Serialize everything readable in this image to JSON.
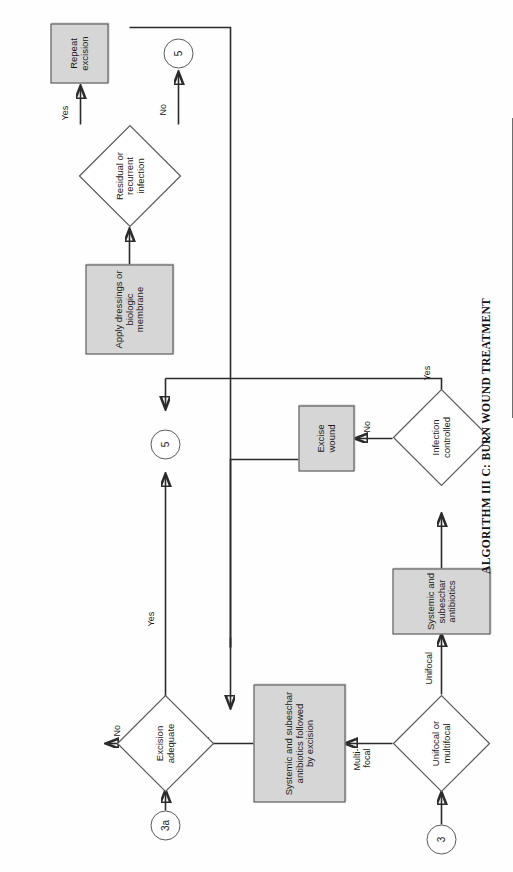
{
  "caption": {
    "text": "ALGORITHM III C:  BURN WOUND TREATMENT"
  },
  "colors": {
    "process_fill": "#d6d6d6",
    "stroke": "#2b2b2b",
    "node_border": "#4a4a4a",
    "page_background": "#ffffff"
  },
  "nodes": {
    "entry_3": {
      "label": "3",
      "shape": "connector"
    },
    "entry_3a": {
      "label": "3a",
      "shape": "connector"
    },
    "exit_5_top": {
      "label": "5",
      "shape": "connector"
    },
    "exit_5_mid": {
      "label": "5",
      "shape": "connector"
    },
    "unifocal_or_multifocal": {
      "label": "Unifocal or\nmultifocal",
      "shape": "decision"
    },
    "infection_controlled": {
      "label": "Infection\ncontrolled",
      "shape": "decision"
    },
    "excision_adequate": {
      "label": "Excision\nadequate",
      "shape": "decision"
    },
    "residual_or_recurrent_infection": {
      "label": "Residual or\nrecurrent\ninfection",
      "shape": "decision"
    },
    "systemic_subeschar_antibiotics": {
      "label": "Systemic and subeschar\nantibiotics",
      "shape": "process"
    },
    "systemic_subeschar_antibiotics_excision": {
      "label": "Systemic and subeschar\nantibiotics followed\nby excision",
      "shape": "process"
    },
    "excise_wound": {
      "label": "Excise wound",
      "shape": "process"
    },
    "apply_dressings": {
      "label": "Apply dressings or\nbiologic\nmembrane",
      "shape": "process"
    },
    "repeat_excision": {
      "label": "Repeat excision",
      "shape": "process"
    }
  },
  "edge_labels": {
    "unifocal": "Unifocal",
    "multifocal": "Multi-\nfocal",
    "infection_no": "No",
    "infection_yes": "Yes",
    "excision_yes": "Yes",
    "excision_no": "No",
    "residual_yes": "Yes",
    "residual_no": "No"
  }
}
